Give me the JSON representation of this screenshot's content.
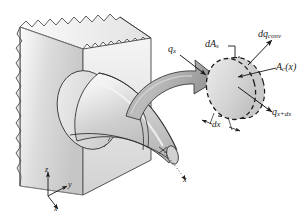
{
  "figure": {
    "domain": "Diagram",
    "background_color": "#ffffff",
    "ink_color": "#1a1a1a"
  },
  "labels": {
    "heat_in": {
      "symbol": "q",
      "subscript": "x",
      "text": "q_x"
    },
    "surface_area": {
      "symbol": "dA",
      "subscript": "s",
      "text": "dA_s"
    },
    "convection": {
      "symbol": "dq",
      "subscript": "conv",
      "text": "dq_conv"
    },
    "cross_section": {
      "symbol": "A",
      "subscript": "c",
      "argument": "(x)",
      "text": "A_c(x)"
    },
    "heat_out": {
      "symbol": "q",
      "subscript": "x+dx",
      "text": "q_x+dx"
    },
    "thickness": {
      "symbol": "dx",
      "text": "dx"
    }
  },
  "axes": {
    "origin_label": "",
    "items": [
      {
        "name": "z",
        "label": "z",
        "direction": "up"
      },
      {
        "name": "y",
        "label": "y",
        "direction": "right-up"
      },
      {
        "name": "x",
        "label": "x",
        "direction": "right-down"
      }
    ],
    "cone_axis": {
      "name": "x",
      "label": "x",
      "direction": "right-down"
    }
  },
  "geometry": {
    "wall": {
      "name": "base-wall",
      "description": "hatched broken-edge slab",
      "face_color": "#d9d9d9",
      "edge_color": "#f2f2f2",
      "outline": "#2b2b2b"
    },
    "fin": {
      "name": "conical-fin",
      "description": "tapered cone protruding from wall",
      "body_color": "#cfcfcf",
      "highlight_color": "#f4f4f4",
      "outline": "#2b2b2b"
    },
    "element": {
      "name": "differential-element",
      "description": "dashed elliptical disk of thickness dx",
      "fill_color": "#d6d6d6",
      "dash_color": "#1a1a1a"
    },
    "callout_arrow": {
      "name": "magnify-arrow",
      "description": "thick curved block arrow from fin to element",
      "fill_color": "#b3b3b3",
      "outline": "#2b2b2b"
    }
  }
}
